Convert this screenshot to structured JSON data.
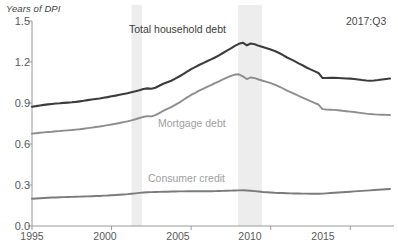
{
  "chart_data": {
    "type": "line",
    "title": "",
    "ylabel": "Years of DPI",
    "xlabel": "",
    "ylim": [
      0.0,
      1.5
    ],
    "xlim": [
      1995.0,
      2017.75
    ],
    "grid": false,
    "legend_position": "inline-annotations",
    "yticks": [
      "0.0",
      "0.3",
      "0.6",
      "0.9",
      "1.2",
      "1.5"
    ],
    "ytick_values": [
      0.0,
      0.3,
      0.6,
      0.9,
      1.2,
      1.5
    ],
    "xticks": [
      "1995",
      "2000",
      "2005",
      "2010",
      "2015"
    ],
    "xtick_values": [
      1995,
      2000,
      2005,
      2010,
      2015
    ],
    "annotations": [
      {
        "text": "2017:Q3",
        "x": 2016.4,
        "y": 1.45
      }
    ],
    "shaded_regions": [
      {
        "name": "recession-2001",
        "x0": 2001.25,
        "x1": 2001.9,
        "color": "#ededed"
      },
      {
        "name": "recession-2008",
        "x0": 2007.95,
        "x1": 2009.45,
        "color": "#ededed"
      }
    ],
    "colors": {
      "total_household_debt": "#3c3c3c",
      "mortgage_debt": "#8e8e8e",
      "consumer_credit": "#7b7b7b",
      "axis": "#9a9a9a",
      "recession_band": "#ededed"
    },
    "x": [
      1995.0,
      1995.25,
      1995.5,
      1995.75,
      1996.0,
      1996.25,
      1996.5,
      1996.75,
      1997.0,
      1997.25,
      1997.5,
      1997.75,
      1998.0,
      1998.25,
      1998.5,
      1998.75,
      1999.0,
      1999.25,
      1999.5,
      1999.75,
      2000.0,
      2000.25,
      2000.5,
      2000.75,
      2001.0,
      2001.25,
      2001.5,
      2001.75,
      2002.0,
      2002.25,
      2002.5,
      2002.75,
      2003.0,
      2003.25,
      2003.5,
      2003.75,
      2004.0,
      2004.25,
      2004.5,
      2004.75,
      2005.0,
      2005.25,
      2005.5,
      2005.75,
      2006.0,
      2006.25,
      2006.5,
      2006.75,
      2007.0,
      2007.25,
      2007.5,
      2007.75,
      2008.0,
      2008.25,
      2008.5,
      2008.75,
      2009.0,
      2009.25,
      2009.5,
      2009.75,
      2010.0,
      2010.25,
      2010.5,
      2010.75,
      2011.0,
      2011.25,
      2011.5,
      2011.75,
      2012.0,
      2012.25,
      2012.5,
      2012.75,
      2013.0,
      2013.25,
      2013.5,
      2013.75,
      2014.0,
      2014.25,
      2014.5,
      2014.75,
      2015.0,
      2015.25,
      2015.5,
      2015.75,
      2016.0,
      2016.25,
      2016.5,
      2016.75,
      2017.0,
      2017.25,
      2017.5
    ],
    "series": [
      {
        "name": "Total household debt",
        "color": "#3c3c3c",
        "values": [
          0.873,
          0.877,
          0.882,
          0.886,
          0.89,
          0.893,
          0.896,
          0.898,
          0.901,
          0.903,
          0.905,
          0.908,
          0.912,
          0.916,
          0.921,
          0.925,
          0.929,
          0.933,
          0.938,
          0.943,
          0.949,
          0.954,
          0.96,
          0.966,
          0.972,
          0.979,
          0.986,
          0.994,
          1.003,
          1.007,
          1.004,
          1.012,
          1.026,
          1.041,
          1.052,
          1.063,
          1.078,
          1.094,
          1.112,
          1.13,
          1.148,
          1.163,
          1.178,
          1.192,
          1.206,
          1.219,
          1.233,
          1.249,
          1.266,
          1.283,
          1.3,
          1.318,
          1.333,
          1.341,
          1.322,
          1.335,
          1.33,
          1.318,
          1.309,
          1.3,
          1.291,
          1.281,
          1.268,
          1.252,
          1.235,
          1.221,
          1.206,
          1.19,
          1.176,
          1.16,
          1.146,
          1.133,
          1.12,
          1.084,
          1.083,
          1.084,
          1.085,
          1.083,
          1.081,
          1.079,
          1.078,
          1.076,
          1.072,
          1.068,
          1.065,
          1.063,
          1.065,
          1.068,
          1.072,
          1.076,
          1.079
        ]
      },
      {
        "name": "Mortgage debt",
        "color": "#8e8e8e",
        "values": [
          0.676,
          0.679,
          0.682,
          0.685,
          0.688,
          0.69,
          0.693,
          0.695,
          0.698,
          0.7,
          0.702,
          0.705,
          0.708,
          0.712,
          0.716,
          0.72,
          0.724,
          0.728,
          0.733,
          0.738,
          0.743,
          0.748,
          0.754,
          0.76,
          0.766,
          0.773,
          0.781,
          0.79,
          0.799,
          0.803,
          0.802,
          0.811,
          0.826,
          0.843,
          0.857,
          0.87,
          0.886,
          0.903,
          0.922,
          0.941,
          0.959,
          0.974,
          0.99,
          1.004,
          1.018,
          1.031,
          1.045,
          1.059,
          1.073,
          1.086,
          1.098,
          1.108,
          1.11,
          1.095,
          1.075,
          1.087,
          1.082,
          1.072,
          1.063,
          1.054,
          1.045,
          1.035,
          1.022,
          1.008,
          0.993,
          0.98,
          0.967,
          0.953,
          0.94,
          0.926,
          0.913,
          0.901,
          0.889,
          0.855,
          0.852,
          0.851,
          0.85,
          0.847,
          0.843,
          0.84,
          0.837,
          0.834,
          0.83,
          0.826,
          0.822,
          0.819,
          0.817,
          0.815,
          0.814,
          0.813,
          0.812
        ]
      },
      {
        "name": "Consumer credit",
        "color": "#7b7b7b",
        "values": [
          0.199,
          0.201,
          0.203,
          0.205,
          0.207,
          0.208,
          0.209,
          0.21,
          0.211,
          0.212,
          0.213,
          0.214,
          0.215,
          0.216,
          0.217,
          0.218,
          0.219,
          0.22,
          0.222,
          0.223,
          0.225,
          0.227,
          0.229,
          0.231,
          0.233,
          0.236,
          0.239,
          0.242,
          0.245,
          0.247,
          0.248,
          0.249,
          0.25,
          0.251,
          0.251,
          0.252,
          0.252,
          0.253,
          0.253,
          0.254,
          0.254,
          0.254,
          0.254,
          0.254,
          0.254,
          0.254,
          0.255,
          0.256,
          0.257,
          0.258,
          0.259,
          0.26,
          0.261,
          0.262,
          0.26,
          0.258,
          0.255,
          0.252,
          0.249,
          0.247,
          0.245,
          0.243,
          0.242,
          0.241,
          0.24,
          0.239,
          0.238,
          0.238,
          0.237,
          0.237,
          0.236,
          0.236,
          0.236,
          0.237,
          0.239,
          0.241,
          0.243,
          0.245,
          0.247,
          0.249,
          0.251,
          0.253,
          0.255,
          0.257,
          0.259,
          0.261,
          0.263,
          0.265,
          0.267,
          0.269,
          0.271
        ]
      }
    ]
  },
  "labels": {
    "y_axis_title": "Years of DPI",
    "total_household_debt": "Total household debt",
    "mortgage_debt": "Mortgage debt",
    "consumer_credit": "Consumer credit",
    "date_annotation": "2017:Q3"
  },
  "y_ticks": [
    {
      "text": "1.5"
    },
    {
      "text": "1.2"
    },
    {
      "text": "0.9"
    },
    {
      "text": "0.6"
    },
    {
      "text": "0.3"
    },
    {
      "text": "0.0"
    }
  ],
  "x_ticks": [
    {
      "text": "1995"
    },
    {
      "text": "2000"
    },
    {
      "text": "2005"
    },
    {
      "text": "2010"
    },
    {
      "text": "2015"
    }
  ]
}
